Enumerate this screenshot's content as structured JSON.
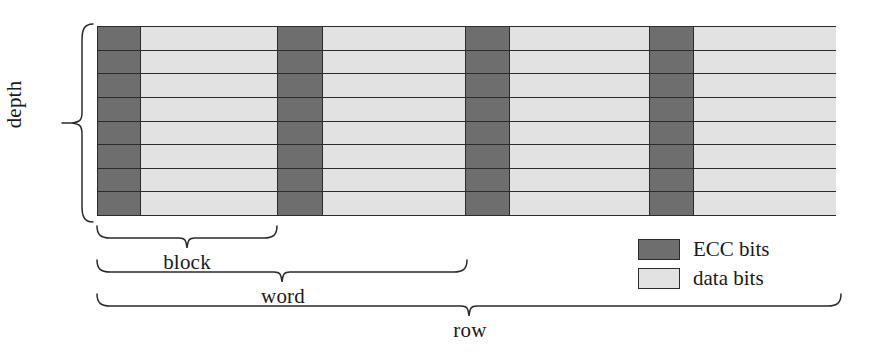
{
  "figure": {
    "colors": {
      "ecc_bits": "#6e6e6e",
      "data_bits": "#e2e2e2",
      "line": "#2b2b2b",
      "background": "#ffffff"
    }
  },
  "labels": {
    "depth": "depth",
    "block": "block",
    "word": "word",
    "row": "row"
  },
  "legend": {
    "items": [
      {
        "swatch": "ecc",
        "label": "ECC bits"
      },
      {
        "swatch": "data",
        "label": "data bits"
      }
    ]
  },
  "grid": {
    "rows": 8,
    "row_count_label": "8",
    "columns": [
      {
        "type": "ecc",
        "name": "ecc-bits-block-1",
        "width_class": "w-ecc"
      },
      {
        "type": "data",
        "name": "data-bits-block-1",
        "width_class": "w-data"
      },
      {
        "type": "ecc",
        "name": "ecc-bits-block-2",
        "width_class": "w-ecc2"
      },
      {
        "type": "data",
        "name": "data-bits-block-2",
        "width_class": "w-data2"
      },
      {
        "type": "ecc",
        "name": "ecc-bits-block-3",
        "width_class": "w-ecc3"
      },
      {
        "type": "data",
        "name": "data-bits-block-3",
        "width_class": "w-data3"
      },
      {
        "type": "ecc",
        "name": "ecc-bits-block-4",
        "width_class": "w-ecc4"
      },
      {
        "type": "data",
        "name": "data-bits-block-4",
        "width_class": "w-data4"
      }
    ]
  },
  "brackets": {
    "depth": {
      "orientation": "vertical-left",
      "spans": "full grid height"
    },
    "block": {
      "orientation": "horizontal-below",
      "spans": "first ECC + first data column"
    },
    "word": {
      "orientation": "horizontal-below",
      "spans": "first two ECC/data block pairs"
    },
    "row": {
      "orientation": "horizontal-below",
      "spans": "entire grid width"
    }
  }
}
